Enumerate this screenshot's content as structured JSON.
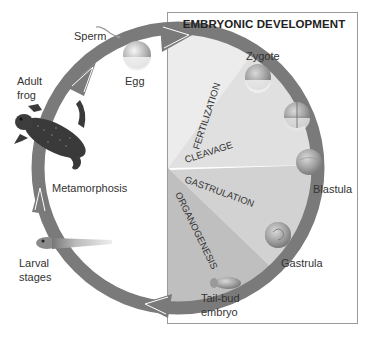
{
  "box": {
    "title": "EMBRYONIC DEVELOPMENT"
  },
  "stages": {
    "sperm": "Sperm",
    "egg": "Egg",
    "zygote": "Zygote",
    "blastula": "Blastula",
    "gastrula": "Gastrula",
    "tailbud_1": "Tail-bud",
    "tailbud_2": "embryo",
    "larval_1": "Larval",
    "larval_2": "stages",
    "metamorphosis": "Metamorphosis",
    "adult_1": "Adult",
    "adult_2": "frog"
  },
  "phases": {
    "fertilization": "FERTILIZATION",
    "cleavage": "CLEAVAGE",
    "gastrulation": "GASTRULATION",
    "organogenesis": "ORGANOGENESIS"
  },
  "colors": {
    "ring": "#7a7a7a",
    "arrow_highlight": "#ffffff",
    "box_border": "#9a9a9a",
    "sector_fertilization": "#e9e9e9",
    "sector_cleavage": "#dcdcdc",
    "sector_gastrulation": "#cfcfcf",
    "sector_organogenesis": "#bdbdbd"
  }
}
